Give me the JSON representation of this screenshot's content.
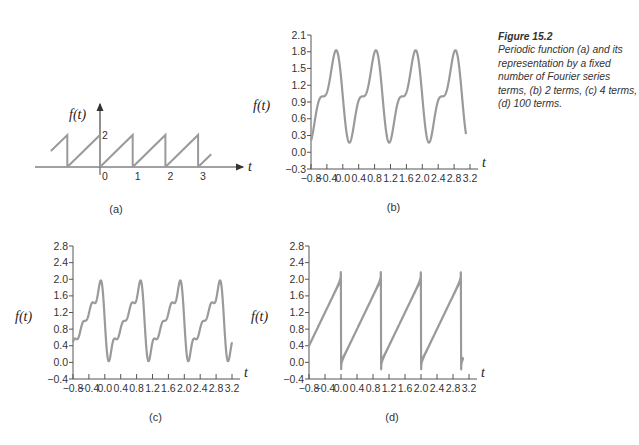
{
  "caption": {
    "title": "Figure 15.2",
    "text": "Periodic function (a) and its representation by a fixed number of Fourier series terms, (b) 2 terms, (c) 4 terms, (d) 100 terms."
  },
  "colors": {
    "curve": "#9a9a9a",
    "axis": "#555555",
    "text": "#333333"
  },
  "chart_data": [
    {
      "panel": "a",
      "type": "line",
      "title": "(a)",
      "xlabel": "t",
      "ylabel": "f(t)",
      "x_ticks": [
        "0",
        "1",
        "2",
        "3"
      ],
      "y_ticks": [
        "2"
      ],
      "description": "Sawtooth wave f(t)=2(t - floor(t)), rising from 0 to 2 over each unit period, drawn from t≈-1.5 to t≈3.4",
      "period": 1,
      "amplitude": 2,
      "x_range": [
        -1.5,
        3.4
      ]
    },
    {
      "panel": "b",
      "type": "line",
      "title": "(b)",
      "xlabel": "t",
      "ylabel": "f(t)",
      "n_terms": 2,
      "x_ticks": [
        "-0.8",
        "-0.4",
        "0.0",
        "0.4",
        "0.8",
        "1.2",
        "1.6",
        "2.0",
        "2.4",
        "2.8",
        "3.2"
      ],
      "y_ticks": [
        "-0.3",
        "0.0",
        "0.3",
        "0.6",
        "0.9",
        "1.2",
        "1.5",
        "1.8",
        "2.1"
      ],
      "xlim": [
        -0.8,
        3.2
      ],
      "ylim": [
        -0.3,
        2.1
      ],
      "x_range": [
        -0.8,
        3.1
      ],
      "peaks": {
        "max": 1.83,
        "min": 0.2
      }
    },
    {
      "panel": "c",
      "type": "line",
      "title": "(c)",
      "xlabel": "t",
      "ylabel": "f(t)",
      "n_terms": 4,
      "x_ticks": [
        "-0.8",
        "-0.4",
        "0.0",
        "0.4",
        "0.8",
        "1.2",
        "1.6",
        "2.0",
        "2.4",
        "2.8",
        "3.2"
      ],
      "y_ticks": [
        "-0.4",
        "0.0",
        "0.4",
        "0.8",
        "1.2",
        "1.6",
        "2.0",
        "2.4",
        "2.8"
      ],
      "xlim": [
        -0.8,
        3.2
      ],
      "ylim": [
        -0.4,
        2.8
      ],
      "x_range": [
        -0.8,
        3.2
      ],
      "peaks": {
        "max": 1.98,
        "min": 0.02
      }
    },
    {
      "panel": "d",
      "type": "line",
      "title": "(d)",
      "xlabel": "t",
      "ylabel": "f(t)",
      "n_terms": 100,
      "x_ticks": [
        "-0.8",
        "-0.4",
        "0.0",
        "0.4",
        "0.8",
        "1.2",
        "1.6",
        "2.0",
        "2.4",
        "2.8",
        "3.2"
      ],
      "y_ticks": [
        "-0.4",
        "0.0",
        "0.4",
        "0.8",
        "1.2",
        "1.6",
        "2.0",
        "2.4",
        "2.8"
      ],
      "xlim": [
        -0.8,
        3.2
      ],
      "ylim": [
        -0.4,
        2.8
      ],
      "x_range": [
        -0.8,
        3.05
      ],
      "peaks": {
        "max": 2.0,
        "min": 0.0
      }
    }
  ]
}
